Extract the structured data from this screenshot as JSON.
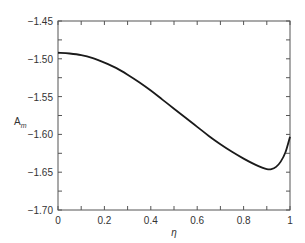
{
  "chart_data": {
    "type": "line",
    "title": "",
    "xlabel": "η",
    "ylabel": "A_m",
    "ylabel_main": "A",
    "ylabel_sub": "m",
    "xlim": [
      0,
      1
    ],
    "ylim": [
      -1.7,
      -1.45
    ],
    "grid": false,
    "legend": null,
    "x_ticks": [
      "0",
      "0.2",
      "0.4",
      "0.6",
      "0.8",
      "1"
    ],
    "y_ticks": [
      "-1.45",
      "-1.50",
      "-1.55",
      "-1.60",
      "-1.65",
      "-1.70"
    ],
    "series": [
      {
        "name": "A_m",
        "x": [
          0.0,
          0.05,
          0.1,
          0.15,
          0.2,
          0.25,
          0.3,
          0.35,
          0.4,
          0.45,
          0.5,
          0.55,
          0.6,
          0.65,
          0.7,
          0.75,
          0.8,
          0.85,
          0.88,
          0.9,
          0.92,
          0.94,
          0.96,
          0.98,
          1.0
        ],
        "values": [
          -1.492,
          -1.493,
          -1.495,
          -1.499,
          -1.505,
          -1.512,
          -1.521,
          -1.531,
          -1.542,
          -1.554,
          -1.566,
          -1.578,
          -1.59,
          -1.602,
          -1.613,
          -1.623,
          -1.632,
          -1.64,
          -1.644,
          -1.646,
          -1.646,
          -1.643,
          -1.636,
          -1.624,
          -1.603
        ]
      }
    ]
  }
}
